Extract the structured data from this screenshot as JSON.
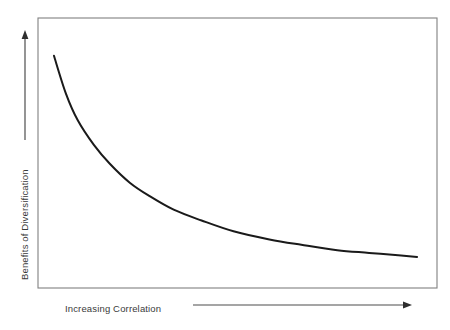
{
  "chart_data": {
    "type": "line",
    "title": "",
    "subtitle": "",
    "xlabel": "Increasing Correlation",
    "ylabel": "Benefits of Diversification",
    "grid": false,
    "legend": null,
    "legend_position": "none",
    "xlim": [
      0,
      1
    ],
    "ylim": [
      0,
      1
    ],
    "xticks": [],
    "yticks": [],
    "xticklabels": [],
    "yticklabels": [],
    "annotations": [
      "y-axis arrow points upward indicating increasing benefits of diversification",
      "x-axis arrow points rightward indicating increasing correlation"
    ],
    "series": [
      {
        "name": "Benefits of Diversification vs Correlation",
        "color": "#1a1a1a",
        "x": [
          0.04,
          0.07,
          0.1,
          0.14,
          0.18,
          0.23,
          0.28,
          0.34,
          0.41,
          0.49,
          0.58,
          0.66,
          0.75,
          0.83,
          0.91,
          0.95
        ],
        "y": [
          0.86,
          0.72,
          0.62,
          0.53,
          0.46,
          0.39,
          0.34,
          0.29,
          0.25,
          0.21,
          0.18,
          0.16,
          0.14,
          0.13,
          0.12,
          0.115
        ]
      }
    ]
  },
  "axes": {
    "x_label": "Increasing Correlation",
    "y_label": "Benefits of Diversification"
  },
  "colors": {
    "curve": "#1a1a1a",
    "frame": "#808080",
    "arrow": "#4d4d4d",
    "text": "#3a3a3a",
    "background": "#ffffff"
  }
}
